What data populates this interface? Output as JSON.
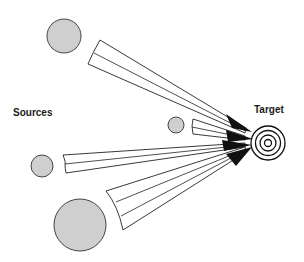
{
  "labels": {
    "sources": "Sources",
    "target": "Target"
  },
  "colors": {
    "source_fill": "#cfcfcf",
    "line": "#222222",
    "arrowhead": "#111111",
    "background": "#ffffff"
  },
  "sources": [
    {
      "name": "source-top",
      "cx": 64,
      "cy": 36,
      "r": 17
    },
    {
      "name": "source-small-middle",
      "cx": 176,
      "cy": 125,
      "r": 8
    },
    {
      "name": "source-left-middle",
      "cx": 42,
      "cy": 166,
      "r": 11
    },
    {
      "name": "source-large-bottom",
      "cx": 80,
      "cy": 225,
      "r": 26
    }
  ],
  "target": {
    "cx": 268,
    "cy": 143,
    "rings": [
      17,
      12.5,
      8,
      3.5
    ]
  }
}
